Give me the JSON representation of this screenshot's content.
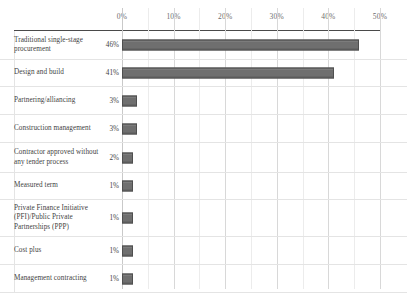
{
  "chart_data": {
    "type": "bar",
    "orientation": "horizontal",
    "title": "",
    "xlabel": "",
    "ylabel": "",
    "xlim": [
      0,
      50
    ],
    "grid": true,
    "legend": null,
    "axis_ticks": [
      "0%",
      "10%",
      "20%",
      "30%",
      "40%",
      "50%"
    ],
    "axis_tick_values": [
      0,
      10,
      20,
      30,
      40,
      50
    ],
    "minor_tick_values": [
      5,
      15,
      25,
      35,
      45
    ],
    "categories": [
      "Traditional single-stage procurement",
      "Design and build",
      "Partnering/alliancing",
      "Construction management",
      "Contractor approved without any tender process",
      "Measured term",
      "Private Finance Initiative (PFI)/Public Private Partnerships (PPP)",
      "Cost plus",
      "Management contracting"
    ],
    "values": [
      46,
      41,
      3,
      3,
      2,
      1,
      1,
      1,
      1
    ],
    "value_labels": [
      "46%",
      "41%",
      "3%",
      "3%",
      "2%",
      "1%",
      "1%",
      "1%",
      "1%"
    ],
    "bar_color": "#6f6f6f",
    "bar_border_color": "#4f4f4f"
  },
  "rows": [
    {
      "label": "Traditional single-stage procurement",
      "value_label": "46%",
      "value": 46,
      "height": 29
    },
    {
      "label": "Design and build",
      "value_label": "41%",
      "value": 41,
      "height": 27
    },
    {
      "label": "Partnering/alliancing",
      "value_label": "3%",
      "value": 3,
      "height": 28
    },
    {
      "label": "Construction management",
      "value_label": "3%",
      "value": 3,
      "height": 28
    },
    {
      "label": "Contractor approved without any tender process",
      "value_label": "2%",
      "value": 2,
      "height": 30
    },
    {
      "label": "Measured term",
      "value_label": "1%",
      "value": 1,
      "height": 27
    },
    {
      "label": "Private Finance Initiative (PFI)/Public Private Partnerships (PPP)",
      "value_label": "1%",
      "value": 1,
      "height": 37
    },
    {
      "label": "Cost plus",
      "value_label": "1%",
      "value": 1,
      "height": 28
    },
    {
      "label": "Management contracting",
      "value_label": "1%",
      "value": 1,
      "height": 28
    }
  ]
}
